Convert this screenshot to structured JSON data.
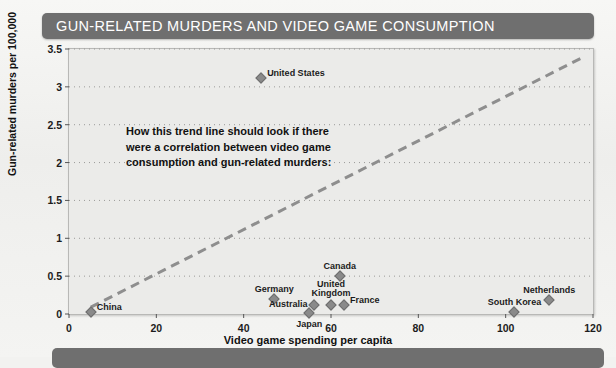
{
  "title": "GUN-RELATED MURDERS AND VIDEO GAME CONSUMPTION",
  "annotation": "How this trend line should look if there were a correlation between video game consumption and gun-related murders:",
  "colors": {
    "banner": "#6f6f6f",
    "banner_text": "#ffffff",
    "plot_background": "#ebebe9",
    "marker": "#8a8a8a",
    "trend_line": "#8e8e8e",
    "gridline": "#9a9a98",
    "text": "#111111"
  },
  "chart_data": {
    "type": "scatter",
    "title": "GUN-RELATED MURDERS AND VIDEO GAME CONSUMPTION",
    "xlabel": "Video game spending per capita",
    "ylabel": "Gun-related murders per 100,000",
    "xlim": [
      0,
      120
    ],
    "ylim": [
      0,
      3.5
    ],
    "xticks": [
      "0",
      "20",
      "40",
      "60",
      "80",
      "100",
      "120"
    ],
    "xtick_values": [
      0,
      20,
      40,
      60,
      80,
      100,
      120
    ],
    "yticks": [
      "0",
      "0.5",
      "1",
      "1.5",
      "2",
      "2.5",
      "3",
      "3.5"
    ],
    "ytick_values": [
      0,
      0.5,
      1,
      1.5,
      2,
      2.5,
      3,
      3.5
    ],
    "grid": "horizontal-dotted",
    "legend": "none",
    "points": [
      {
        "label": "United States",
        "x": 44,
        "y": 3.12,
        "label_pos": "right"
      },
      {
        "label": "Canada",
        "x": 62,
        "y": 0.5,
        "label_pos": "above"
      },
      {
        "label": "Germany",
        "x": 47,
        "y": 0.2,
        "label_pos": "above"
      },
      {
        "label": "United Kingdom",
        "x": 60,
        "y": 0.12,
        "label_pos": "above"
      },
      {
        "label": "France",
        "x": 63,
        "y": 0.12,
        "label_pos": "right"
      },
      {
        "label": "Australia",
        "x": 56,
        "y": 0.12,
        "label_pos": "left"
      },
      {
        "label": "Japan",
        "x": 55,
        "y": 0.01,
        "label_pos": "below"
      },
      {
        "label": "China",
        "x": 5,
        "y": 0.02,
        "label_pos": "right"
      },
      {
        "label": "South Korea",
        "x": 102,
        "y": 0.02,
        "label_pos": "above"
      },
      {
        "label": "Netherlands",
        "x": 110,
        "y": 0.18,
        "label_pos": "above"
      }
    ],
    "trend_line": {
      "style": "dashed",
      "x0": 5,
      "y0": 0.09,
      "x1": 118,
      "y1": 3.4
    }
  }
}
